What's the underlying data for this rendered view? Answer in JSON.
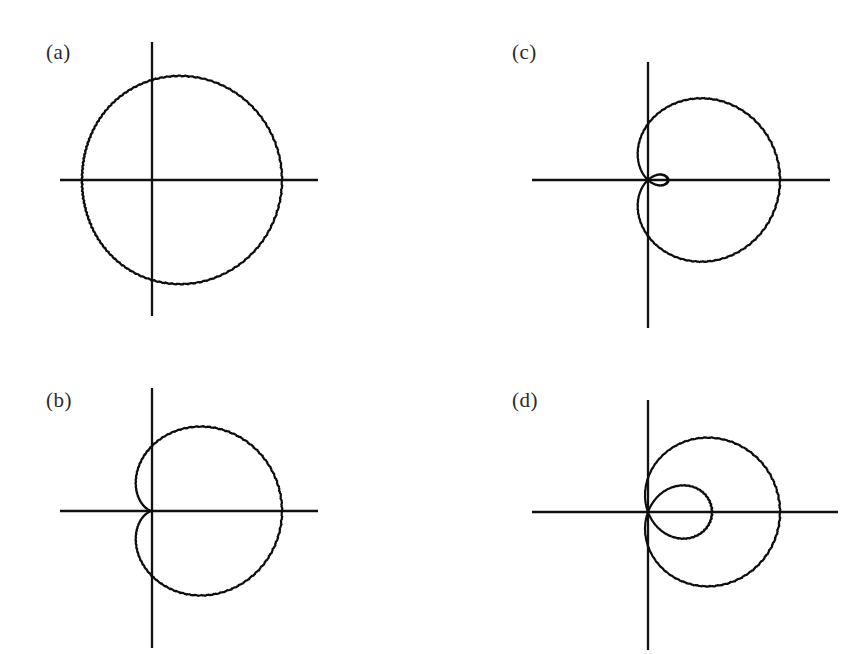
{
  "figure": {
    "background_color": "#ffffff",
    "ink_color": "#0d0d0d",
    "label_color": "#2b2b2b",
    "width": 858,
    "height": 654
  },
  "panels": [
    {
      "id": "a",
      "label": "(a)",
      "label_x": 46,
      "label_y": 40,
      "origin_x": 152,
      "origin_y": 180,
      "x_axis": {
        "x1": 60,
        "x2": 318,
        "y": 180
      },
      "y_axis": {
        "y1": 42,
        "y2": 316,
        "x": 152
      },
      "curve": {
        "type": "limacon",
        "equation": "r = a + b cos(theta)",
        "a": 100,
        "b": 30,
        "scale": 1.0,
        "shape": "convex-limacon",
        "max_radius_px": 130,
        "min_radius_px": 70,
        "samples": 720
      }
    },
    {
      "id": "b",
      "label": "(b)",
      "label_x": 46,
      "label_y": 388,
      "origin_x": 152,
      "origin_y": 511,
      "x_axis": {
        "x1": 60,
        "x2": 318,
        "y": 511
      },
      "y_axis": {
        "y1": 388,
        "y2": 648,
        "x": 152
      },
      "curve": {
        "type": "limacon",
        "equation": "r = a + b cos(theta)",
        "a": 65,
        "b": 65,
        "scale": 1.0,
        "shape": "cardioid",
        "max_radius_px": 130,
        "min_radius_px": 0,
        "samples": 720
      }
    },
    {
      "id": "c",
      "label": "(c)",
      "label_x": 512,
      "label_y": 40,
      "origin_x": 648,
      "origin_y": 180,
      "x_axis": {
        "x1": 532,
        "x2": 830,
        "y": 180
      },
      "y_axis": {
        "y1": 62,
        "y2": 328,
        "x": 648
      },
      "curve": {
        "type": "limacon",
        "equation": "r = a + b cos(theta)",
        "a": 56,
        "b": 76,
        "scale": 1.0,
        "shape": "limacon-with-small-inner-loop",
        "max_radius_px": 132,
        "inner_loop_depth_px": 20,
        "samples": 720
      }
    },
    {
      "id": "d",
      "label": "(d)",
      "label_x": 512,
      "label_y": 388,
      "origin_x": 648,
      "origin_y": 512,
      "x_axis": {
        "x1": 532,
        "x2": 838,
        "y": 512
      },
      "y_axis": {
        "y1": 400,
        "y2": 650,
        "x": 648
      },
      "curve": {
        "type": "limacon",
        "equation": "r = a + b cos(theta)",
        "a": 34,
        "b": 98,
        "scale": 1.0,
        "shape": "limacon-with-large-inner-loop",
        "max_radius_px": 132,
        "inner_loop_depth_px": 64,
        "samples": 720
      }
    }
  ],
  "chart_data": {
    "type": "line",
    "title": "",
    "xlabel": "",
    "ylabel": "",
    "coordinate_system": "polar",
    "grid": false,
    "legend": false,
    "series": [
      {
        "name": "(a) convex limacon",
        "equation": "r = a + b cos(theta)",
        "a": 100,
        "b": 30,
        "ratio_b_over_a": 0.3,
        "classification": "convex (no dimple, no loop)",
        "r_max": 130,
        "r_min": 70,
        "theta_range_deg": [
          0,
          360
        ]
      },
      {
        "name": "(b) cardioid",
        "equation": "r = a + b cos(theta)",
        "a": 65,
        "b": 65,
        "ratio_b_over_a": 1.0,
        "classification": "cardioid (cusp at origin)",
        "r_max": 130,
        "r_min": 0,
        "theta_range_deg": [
          0,
          360
        ]
      },
      {
        "name": "(c) limacon with small inner loop",
        "equation": "r = a + b cos(theta)",
        "a": 56,
        "b": 76,
        "ratio_b_over_a": 1.36,
        "classification": "inner loop",
        "r_max": 132,
        "r_min": -20,
        "theta_range_deg": [
          0,
          360
        ]
      },
      {
        "name": "(d) limacon with large inner loop",
        "equation": "r = a + b cos(theta)",
        "a": 34,
        "b": 98,
        "ratio_b_over_a": 2.88,
        "classification": "large inner loop",
        "r_max": 132,
        "r_min": -64,
        "theta_range_deg": [
          0,
          360
        ]
      }
    ]
  }
}
